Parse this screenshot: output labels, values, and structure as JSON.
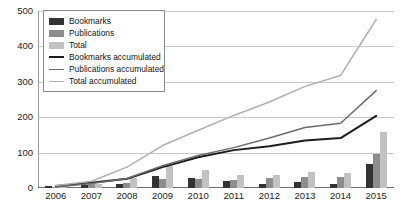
{
  "chart_data": {
    "type": "bar",
    "title": "",
    "subtitle": "",
    "xlabel": "",
    "ylabel": "",
    "ylim": [
      0,
      500
    ],
    "yticks": [
      0,
      100,
      200,
      300,
      400,
      500
    ],
    "grid": true,
    "legend_position": "top-left",
    "categories": [
      "2006",
      "2007",
      "2008",
      "2009",
      "2010",
      "2011",
      "2012",
      "2013",
      "2014",
      "2015"
    ],
    "series": [
      {
        "name": "Bookmarks",
        "kind": "bar",
        "color": "#333333",
        "values": [
          6,
          9,
          11,
          33,
          28,
          20,
          11,
          16,
          12,
          67
        ]
      },
      {
        "name": "Publications",
        "kind": "bar",
        "color": "#8d8d8d",
        "values": [
          2,
          10,
          14,
          26,
          25,
          22,
          27,
          30,
          32,
          96
        ]
      },
      {
        "name": "Total",
        "kind": "bar",
        "color": "#c2c2c2",
        "values": [
          7,
          12,
          28,
          62,
          50,
          37,
          38,
          44,
          42,
          159
        ]
      },
      {
        "name": "Bookmarks accumulated",
        "kind": "line",
        "color": "#1d1d1d",
        "values": [
          6,
          15,
          26,
          59,
          87,
          107,
          118,
          134,
          141,
          204
        ]
      },
      {
        "name": "Publications accumulated",
        "kind": "line",
        "color": "#6b6b6b",
        "values": [
          3,
          13,
          27,
          63,
          92,
          114,
          141,
          171,
          183,
          275
        ]
      },
      {
        "name": "Total accumulated",
        "kind": "line",
        "color": "#b0b0b0",
        "values": [
          7,
          19,
          59,
          120,
          163,
          205,
          243,
          287,
          318,
          476
        ]
      }
    ]
  },
  "legend": {
    "items": [
      {
        "label": "Bookmarks",
        "marker": "swatch",
        "color": "#333333"
      },
      {
        "label": "Publications",
        "marker": "swatch",
        "color": "#8d8d8d"
      },
      {
        "label": "Total",
        "marker": "swatch",
        "color": "#c2c2c2"
      },
      {
        "label": "Bookmarks accumulated",
        "marker": "line",
        "color": "#1d1d1d"
      },
      {
        "label": "Publications accumulated",
        "marker": "line",
        "color": "#6b6b6b"
      },
      {
        "label": "Total accumulated",
        "marker": "line",
        "color": "#b0b0b0"
      }
    ]
  },
  "axes": {
    "y_tick_labels": [
      "500",
      "400",
      "300",
      "200",
      "100",
      "0"
    ],
    "x_tick_labels": [
      "2006",
      "2007",
      "2008",
      "2009",
      "2010",
      "2011",
      "2012",
      "2013",
      "2014",
      "2015"
    ]
  },
  "colors": {
    "gridline": "#c9c9c9",
    "axis": "#6e6e6e",
    "text": "#1c1c1c",
    "background": "#ffffff"
  }
}
